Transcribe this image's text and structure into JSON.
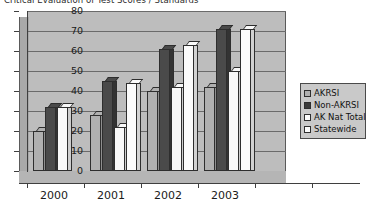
{
  "chart_data": {
    "type": "bar",
    "title": "Critical Evaluation of Test Scores / Standards",
    "xlabel": "",
    "ylabel": "",
    "ylim": [
      0,
      80
    ],
    "yticks": [
      0,
      10,
      20,
      30,
      40,
      50,
      60,
      70,
      80
    ],
    "grid": true,
    "legend_position": "right",
    "categories": [
      "2000",
      "2001",
      "2002",
      "2003"
    ],
    "series": [
      {
        "name": "AKRSI",
        "color": "#b0b0b0",
        "values": [
          20,
          28,
          40,
          42
        ]
      },
      {
        "name": "Non-AKRSI",
        "color": "#3a3a3a",
        "values": [
          32,
          45,
          61,
          71
        ]
      },
      {
        "name": "AK Nat Total",
        "color": "#fbfbfb",
        "values": [
          32,
          22,
          42,
          50
        ]
      },
      {
        "name": "Statewide",
        "color": "#fbfbfb",
        "values": [
          0,
          44,
          63,
          71
        ]
      }
    ]
  },
  "legend": {
    "items": [
      {
        "label": "AKRSI"
      },
      {
        "label": "Non-AKRSI"
      },
      {
        "label": "AK Nat Total"
      },
      {
        "label": "Statewide"
      }
    ]
  }
}
